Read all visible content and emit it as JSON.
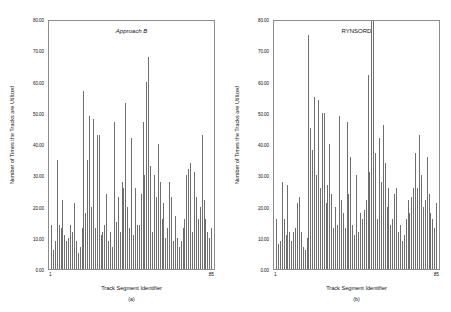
{
  "figure": {
    "width": 451,
    "height": 312,
    "background": "#ffffff",
    "bar_color": "#6e6e6e",
    "axis_color": "#8c8c8c"
  },
  "chart_data": [
    {
      "type": "bar",
      "title": "Approach B",
      "caption": "(a)",
      "xlabel": "Track Segment Identifier",
      "ylabel": "Number of Times the Tracks are Utilized",
      "xticklabels": [
        "1",
        "85"
      ],
      "yticklabels": [
        "0.00",
        "10.00",
        "20.00",
        "30.00",
        "40.00",
        "50.00",
        "60.00",
        "70.00",
        "80.00"
      ],
      "ytickvalues": [
        0,
        10,
        20,
        30,
        40,
        50,
        60,
        70,
        80
      ],
      "ylim": [
        0,
        80
      ],
      "xlim": [
        1,
        85
      ],
      "grid": false,
      "legend": "none",
      "categories": [
        1,
        2,
        3,
        4,
        5,
        6,
        7,
        8,
        9,
        10,
        11,
        12,
        13,
        14,
        15,
        16,
        17,
        18,
        19,
        20,
        21,
        22,
        23,
        24,
        25,
        26,
        27,
        28,
        29,
        30,
        31,
        32,
        33,
        34,
        35,
        36,
        37,
        38,
        39,
        40,
        41,
        42,
        43,
        44,
        45,
        46,
        47,
        48,
        49,
        50,
        51,
        52,
        53,
        54,
        55,
        56,
        57,
        58,
        59,
        60,
        61,
        62,
        63,
        64,
        65,
        66,
        67,
        68,
        69,
        70,
        71,
        72,
        73,
        74,
        75,
        76,
        77,
        78,
        79,
        80,
        81,
        82,
        83,
        84,
        85
      ],
      "values": [
        14,
        6,
        9,
        35,
        14,
        13,
        22,
        11,
        9,
        10,
        14,
        12,
        21,
        9,
        5,
        7,
        13,
        57,
        18,
        35,
        49,
        20,
        48,
        13,
        43,
        43,
        11,
        12,
        14,
        24,
        9,
        12,
        7,
        47,
        15,
        23,
        12,
        28,
        26,
        53,
        20,
        13,
        42,
        11,
        26,
        14,
        14,
        24,
        47,
        30,
        60,
        68,
        33,
        12,
        30,
        23,
        40,
        28,
        16,
        21,
        10,
        13,
        28,
        23,
        9,
        17,
        10,
        7,
        9,
        13,
        16,
        30,
        32,
        34,
        12,
        31,
        23,
        16,
        20,
        43,
        22,
        16,
        12,
        10,
        13
      ]
    },
    {
      "type": "bar",
      "title": "RYNSORD",
      "caption": "(b)",
      "xlabel": "Track Segment Identifier",
      "ylabel": "Number of Times the Tracks are Utilized",
      "xticklabels": [
        "1",
        "85"
      ],
      "yticklabels": [
        "0.00",
        "10.00",
        "20.00",
        "30.00",
        "40.00",
        "50.00",
        "60.00",
        "70.00",
        "80.00"
      ],
      "ytickvalues": [
        0,
        10,
        20,
        30,
        40,
        50,
        60,
        70,
        80
      ],
      "ylim": [
        0,
        80
      ],
      "xlim": [
        1,
        85
      ],
      "grid": false,
      "legend": "none",
      "categories": [
        1,
        2,
        3,
        4,
        5,
        6,
        7,
        8,
        9,
        10,
        11,
        12,
        13,
        14,
        15,
        16,
        17,
        18,
        19,
        20,
        21,
        22,
        23,
        24,
        25,
        26,
        27,
        28,
        29,
        30,
        31,
        32,
        33,
        34,
        35,
        36,
        37,
        38,
        39,
        40,
        41,
        42,
        43,
        44,
        45,
        46,
        47,
        48,
        49,
        50,
        51,
        52,
        53,
        54,
        55,
        56,
        57,
        58,
        59,
        60,
        61,
        62,
        63,
        64,
        65,
        66,
        67,
        68,
        69,
        70,
        71,
        72,
        73,
        74,
        75,
        76,
        77,
        78,
        79,
        80,
        81,
        82,
        83,
        84,
        85
      ],
      "values": [
        16,
        8,
        9,
        28,
        16,
        11,
        27,
        12,
        9,
        12,
        13,
        21,
        23,
        12,
        7,
        6,
        10,
        75,
        45,
        38,
        55,
        30,
        54,
        26,
        50,
        50,
        21,
        27,
        40,
        24,
        13,
        20,
        14,
        49,
        22,
        18,
        13,
        47,
        24,
        36,
        14,
        11,
        30,
        12,
        18,
        16,
        19,
        22,
        62,
        31,
        80,
        82,
        37,
        16,
        42,
        28,
        46,
        34,
        20,
        26,
        14,
        16,
        24,
        26,
        12,
        14,
        9,
        11,
        16,
        22,
        18,
        23,
        26,
        37,
        26,
        43,
        30,
        20,
        22,
        36,
        24,
        18,
        16,
        13,
        21
      ]
    }
  ]
}
